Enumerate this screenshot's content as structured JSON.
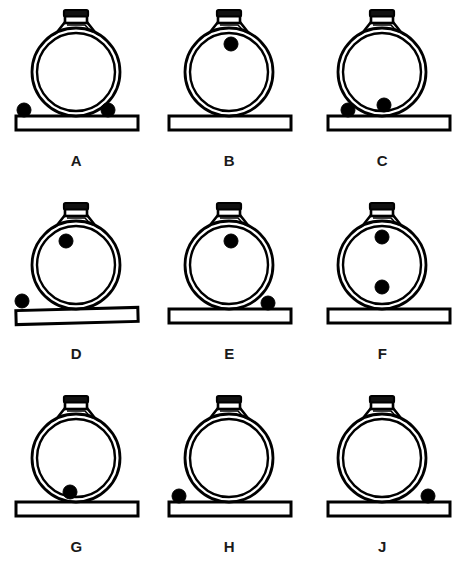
{
  "figure": {
    "background_color": "#ffffff",
    "ink_color": "#000000",
    "columns": 3,
    "rows": 3,
    "panel_count": 9
  },
  "geometry": {
    "body_center_x": 76,
    "body_center_y": 72,
    "body_radius_outer": 44,
    "body_radius_inner": 39,
    "ball_radius": 7,
    "base_top_y": 116,
    "base_height": 14,
    "base_left_x": 16,
    "base_width": 122,
    "neck_top_y": 10
  },
  "panels": [
    {
      "id": "panel-a",
      "label": "A",
      "row": 0,
      "col": 0,
      "base_tilt_deg": 0,
      "base_offset_x": 0,
      "ball_count": 2,
      "balls": [
        {
          "name": "ball-outside-left",
          "cx": 24,
          "cy": 110,
          "inside_flask": false
        },
        {
          "name": "ball-outside-right",
          "cx": 108,
          "cy": 110,
          "inside_flask": false
        }
      ]
    },
    {
      "id": "panel-b",
      "label": "B",
      "row": 0,
      "col": 1,
      "base_tilt_deg": 0,
      "base_offset_x": 0,
      "ball_count": 1,
      "balls": [
        {
          "name": "ball-inside-upper",
          "cx": 78,
          "cy": 44,
          "inside_flask": true
        }
      ]
    },
    {
      "id": "panel-c",
      "label": "C",
      "row": 0,
      "col": 2,
      "base_tilt_deg": 0,
      "base_offset_x": 6,
      "ball_count": 2,
      "balls": [
        {
          "name": "ball-outside-left",
          "cx": 42,
          "cy": 110,
          "inside_flask": false
        },
        {
          "name": "ball-inside-bottom-right",
          "cx": 78,
          "cy": 105,
          "inside_flask": true
        }
      ]
    },
    {
      "id": "panel-d",
      "label": "D",
      "row": 1,
      "col": 0,
      "base_tilt_deg": -1.5,
      "base_offset_x": 0,
      "ball_count": 2,
      "balls": [
        {
          "name": "ball-inside-upper",
          "cx": 66,
          "cy": 48,
          "inside_flask": true
        },
        {
          "name": "ball-outside-left",
          "cx": 22,
          "cy": 108,
          "inside_flask": false
        }
      ]
    },
    {
      "id": "panel-e",
      "label": "E",
      "row": 1,
      "col": 1,
      "base_tilt_deg": 0,
      "base_offset_x": 0,
      "ball_count": 2,
      "balls": [
        {
          "name": "ball-inside-upper",
          "cx": 78,
          "cy": 48,
          "inside_flask": true
        },
        {
          "name": "ball-outside-right",
          "cx": 115,
          "cy": 110,
          "inside_flask": false
        }
      ]
    },
    {
      "id": "panel-f",
      "label": "F",
      "row": 1,
      "col": 2,
      "base_tilt_deg": 0,
      "base_offset_x": 6,
      "ball_count": 2,
      "balls": [
        {
          "name": "ball-inside-upper",
          "cx": 76,
          "cy": 44,
          "inside_flask": true
        },
        {
          "name": "ball-inside-lower",
          "cx": 76,
          "cy": 94,
          "inside_flask": true
        }
      ]
    },
    {
      "id": "panel-g",
      "label": "G",
      "row": 2,
      "col": 0,
      "base_tilt_deg": 0,
      "base_offset_x": 0,
      "ball_count": 1,
      "balls": [
        {
          "name": "ball-inside-bottom",
          "cx": 70,
          "cy": 106,
          "inside_flask": true
        }
      ]
    },
    {
      "id": "panel-h",
      "label": "H",
      "row": 2,
      "col": 1,
      "base_tilt_deg": 0,
      "base_offset_x": 0,
      "ball_count": 1,
      "balls": [
        {
          "name": "ball-outside-left",
          "cx": 26,
          "cy": 110,
          "inside_flask": false
        }
      ]
    },
    {
      "id": "panel-j",
      "label": "J",
      "row": 2,
      "col": 2,
      "base_tilt_deg": 0,
      "base_offset_x": 6,
      "ball_count": 1,
      "balls": [
        {
          "name": "ball-outside-right",
          "cx": 122,
          "cy": 110,
          "inside_flask": false
        }
      ]
    }
  ]
}
